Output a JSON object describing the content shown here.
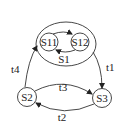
{
  "diagram": {
    "type": "state-machine",
    "composite_state": {
      "label": "S1",
      "substates": [
        "S11",
        "S12"
      ]
    },
    "states": [
      {
        "id": "S11",
        "label": "S11"
      },
      {
        "id": "S12",
        "label": "S12"
      },
      {
        "id": "S2",
        "label": "S2"
      },
      {
        "id": "S3",
        "label": "S3"
      }
    ],
    "transitions": [
      {
        "label": "t1",
        "from": "S1",
        "to": "S3"
      },
      {
        "label": "t2",
        "from": "S3",
        "to": "S2"
      },
      {
        "label": "t3",
        "from": "S2",
        "to": "S3"
      },
      {
        "label": "t4",
        "from": "S2",
        "to": "S1"
      },
      {
        "label": "",
        "from": "S11",
        "to": "S12"
      },
      {
        "label": "",
        "from": "S12",
        "to": "S11"
      }
    ]
  },
  "labels": {
    "s1": "S1",
    "s11": "S11",
    "s12": "S12",
    "s2": "S2",
    "s3": "S3",
    "t1": "t1",
    "t2": "t2",
    "t3": "t3",
    "t4": "t4"
  }
}
